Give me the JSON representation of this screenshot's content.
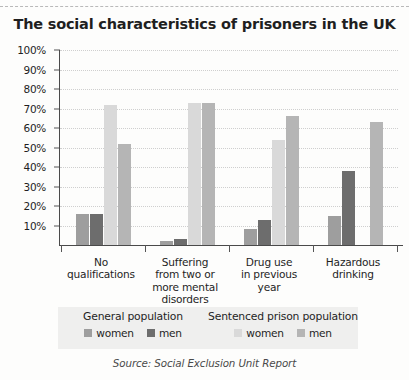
{
  "chart_data": {
    "type": "bar",
    "title": "The social characteristics of prisoners in the UK",
    "xlabel": "",
    "ylabel": "",
    "ylim": [
      0,
      100
    ],
    "grid": true,
    "legend_position": "bottom",
    "source": "Source: Social Exclusion Unit Report",
    "ytick_labels": [
      "100%",
      "90%",
      "80%",
      "70%",
      "60%",
      "50%",
      "40%",
      "30%",
      "20%",
      "10%"
    ],
    "ytick_values": [
      100,
      90,
      80,
      70,
      60,
      50,
      40,
      30,
      20,
      10
    ],
    "categories": [
      "No\nqualifications",
      "Suffering\nfrom two or\nmore mental\ndisorders",
      "Drug use\nin previous\nyear",
      "Hazardous\ndrinking"
    ],
    "category_lines": [
      [
        "No",
        "qualifications"
      ],
      [
        "Suffering",
        "from two or",
        "more mental",
        "disorders"
      ],
      [
        "Drug use",
        "in previous",
        "year"
      ],
      [
        "Hazardous",
        "drinking"
      ]
    ],
    "series": [
      {
        "name": "General population women",
        "group": "General population",
        "sex": "women",
        "color": "#9e9e9e",
        "values": [
          16,
          2,
          8,
          15
        ]
      },
      {
        "name": "General population men",
        "group": "General population",
        "sex": "men",
        "color": "#6d6d6d",
        "values": [
          16,
          3,
          13,
          38
        ]
      },
      {
        "name": "Sentenced prison population women",
        "group": "Sentenced prison population",
        "sex": "women",
        "color": "#d9d9d9",
        "values": [
          72,
          73,
          54,
          0
        ]
      },
      {
        "name": "Sentenced prison population men",
        "group": "Sentenced prison population",
        "sex": "men",
        "color": "#b5b5b5",
        "values": [
          52,
          73,
          66,
          63
        ]
      }
    ],
    "legend": [
      {
        "title": "General population",
        "entries": [
          {
            "label": "women",
            "color": "#9e9e9e"
          },
          {
            "label": "men",
            "color": "#6d6d6d"
          }
        ]
      },
      {
        "title": "Sentenced prison population",
        "entries": [
          {
            "label": "women",
            "color": "#d9d9d9"
          },
          {
            "label": "men",
            "color": "#b5b5b5"
          }
        ]
      }
    ]
  }
}
